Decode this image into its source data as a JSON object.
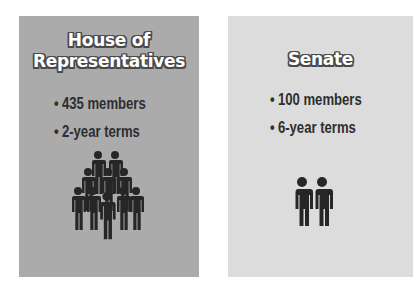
{
  "cards": [
    {
      "id": "house",
      "title_line1": "House of",
      "title_line2": "Representatives",
      "bullets": [
        "435 members",
        "2-year terms"
      ],
      "bullet_glyph": "•",
      "icon": "crowd-of-people-icon",
      "icon_people_count": 10,
      "background": "#ababab"
    },
    {
      "id": "senate",
      "title_line1": "Senate",
      "bullets": [
        "100 members",
        "6-year terms"
      ],
      "bullet_glyph": "•",
      "icon": "two-people-icon",
      "icon_people_count": 2,
      "background": "#dcdcdc"
    }
  ],
  "colors": {
    "text_dark": "#2e2e2e",
    "title_fill": "#ffffff",
    "title_outline": "#4a4a4a",
    "icon": "#262626"
  }
}
